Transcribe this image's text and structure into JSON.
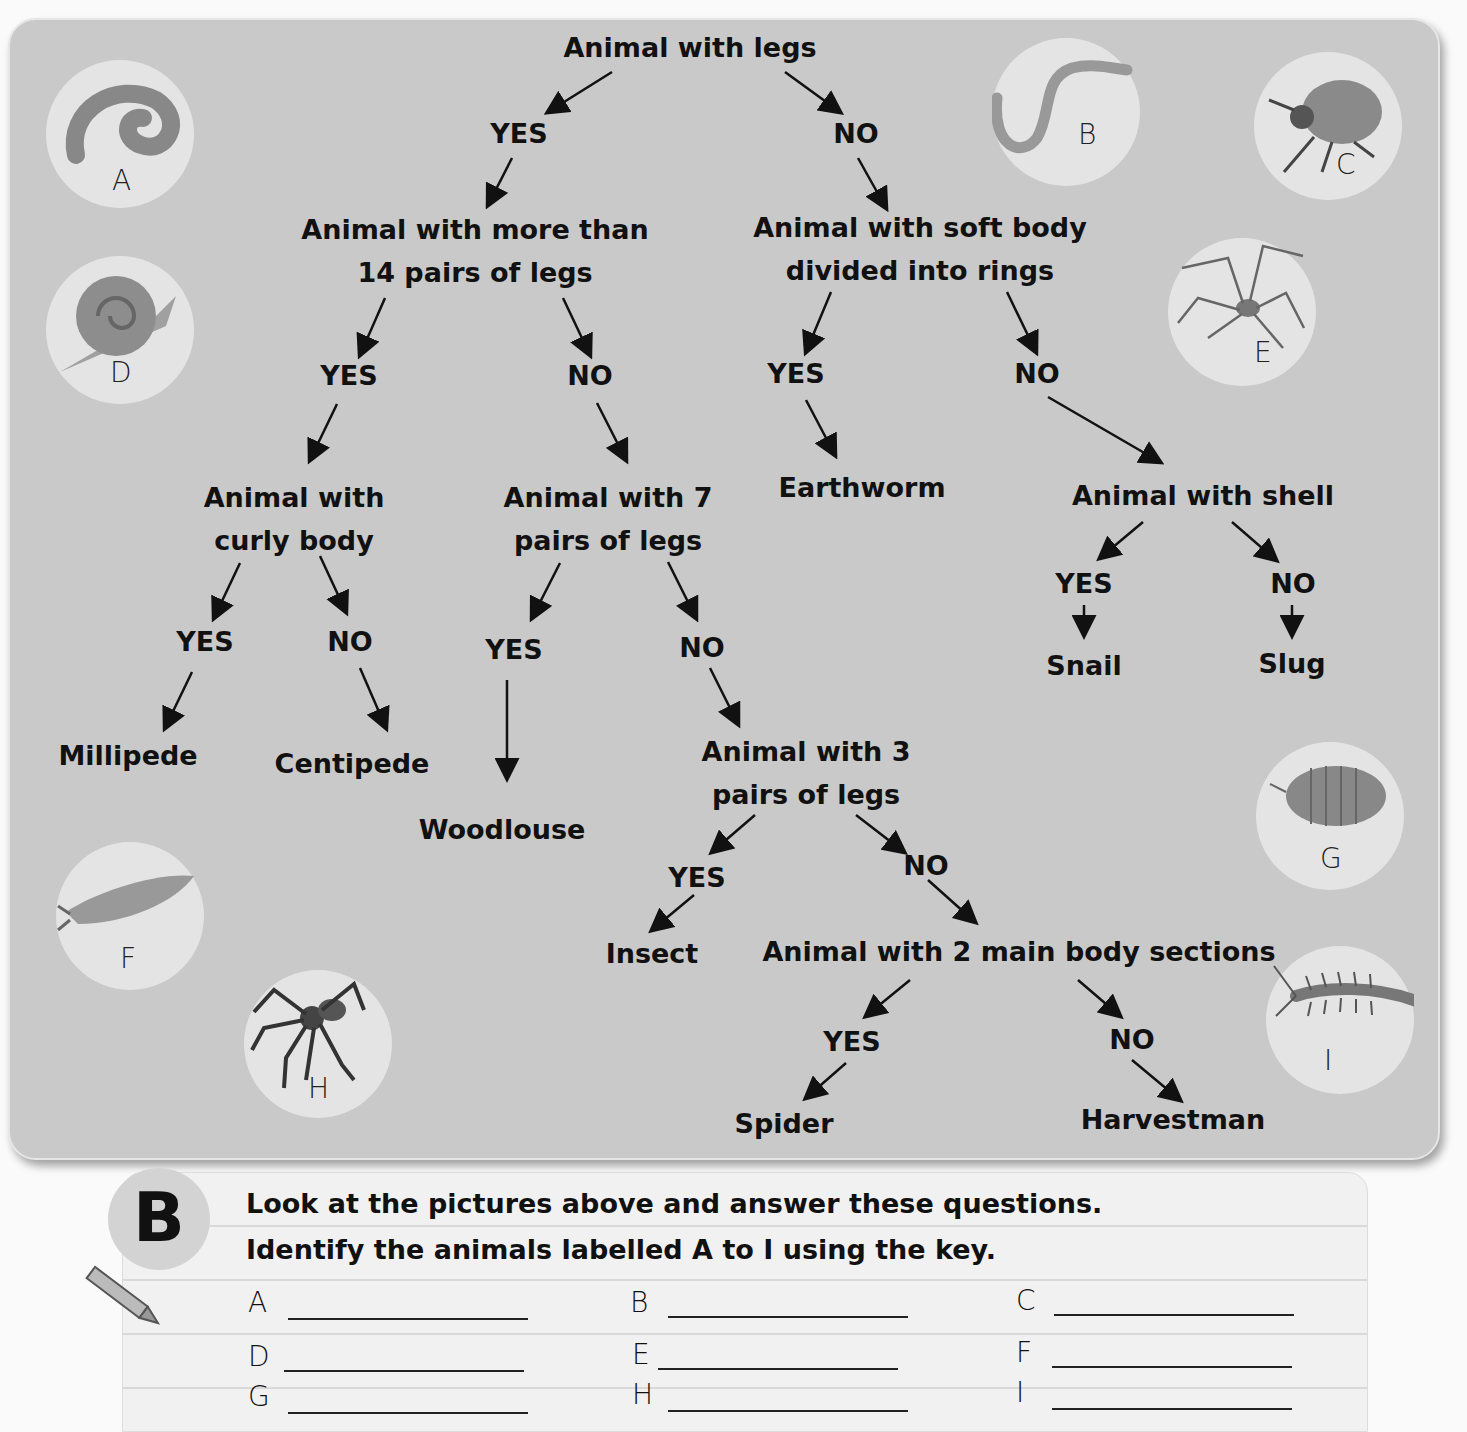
{
  "key": {
    "root": "Animal with legs",
    "yes": "YES",
    "no": "NO",
    "nodes": {
      "more_than_14": "Animal with more than 14 pairs of legs",
      "more_than_14_l1": "Animal with more than",
      "more_than_14_l2": "14 pairs of legs",
      "soft_body_l1": "Animal with soft body",
      "soft_body_l2": "divided into rings",
      "curly_l1": "Animal with",
      "curly_l2": "curly body",
      "seven_l1": "Animal with 7",
      "seven_l2": "pairs of legs",
      "shell": "Animal with shell",
      "three_l1": "Animal with 3",
      "three_l2": "pairs of legs",
      "two_sections": "Animal with 2 main body sections"
    },
    "results": {
      "millipede": "Millipede",
      "centipede": "Centipede",
      "woodlouse": "Woodlouse",
      "earthworm": "Earthworm",
      "snail": "Snail",
      "slug": "Slug",
      "insect": "Insect",
      "spider": "Spider",
      "harvestman": "Harvestman"
    }
  },
  "pictures": [
    {
      "label": "A",
      "animal": "millipede-icon"
    },
    {
      "label": "B",
      "animal": "earthworm-icon"
    },
    {
      "label": "C",
      "animal": "ladybird-icon"
    },
    {
      "label": "D",
      "animal": "snail-icon"
    },
    {
      "label": "E",
      "animal": "harvestman-icon"
    },
    {
      "label": "F",
      "animal": "slug-icon"
    },
    {
      "label": "G",
      "animal": "woodlouse-icon"
    },
    {
      "label": "H",
      "animal": "spider-icon"
    },
    {
      "label": "I",
      "animal": "centipede-icon"
    }
  ],
  "section_b": {
    "badge": "B",
    "line1": "Look at the pictures above and answer these questions.",
    "line2": "Identify the animals labelled A to I using the key.",
    "answers": [
      {
        "label": "A",
        "value": ""
      },
      {
        "label": "B",
        "value": ""
      },
      {
        "label": "C",
        "value": ""
      },
      {
        "label": "D",
        "value": ""
      },
      {
        "label": "E",
        "value": ""
      },
      {
        "label": "F",
        "value": ""
      },
      {
        "label": "G",
        "value": ""
      },
      {
        "label": "H",
        "value": ""
      },
      {
        "label": "I",
        "value": ""
      }
    ]
  }
}
